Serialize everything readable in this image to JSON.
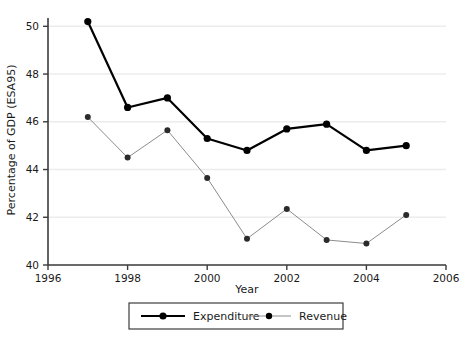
{
  "chart_data": {
    "type": "line",
    "title": "",
    "subtitle": "",
    "xlabel": "Year",
    "ylabel": "Percentage of GDP (ESA95)",
    "xlim": [
      1996,
      2006
    ],
    "ylim": [
      40,
      50.6
    ],
    "xticks": [
      1996,
      1998,
      2000,
      2002,
      2004,
      2006
    ],
    "xtick_labels": [
      "1996",
      "1998",
      "2000",
      "2002",
      "2004",
      "2006"
    ],
    "yticks": [
      40,
      42,
      44,
      46,
      48,
      50
    ],
    "ytick_labels": [
      "40",
      "42",
      "44",
      "46",
      "48",
      "50"
    ],
    "grid": "horizontal",
    "legend_position": "below-center",
    "x": [
      1997,
      1998,
      1999,
      2000,
      2001,
      2002,
      2003,
      2004,
      2005
    ],
    "series": [
      {
        "name": "Expenditure",
        "color": "#000000",
        "line_width": 2.2,
        "marker": "circle",
        "values": [
          50.2,
          46.6,
          47.0,
          45.3,
          44.8,
          45.7,
          45.9,
          44.8,
          45.0
        ]
      },
      {
        "name": "Revenue",
        "color": "#8c8c8c",
        "line_width": 1.0,
        "marker": "circle",
        "values": [
          46.2,
          44.5,
          45.65,
          43.65,
          41.1,
          42.35,
          41.05,
          40.9,
          42.1
        ]
      }
    ]
  },
  "legend": {
    "items": [
      {
        "label": "Expenditure",
        "color": "#000000"
      },
      {
        "label": "Revenue",
        "color": "#8c8c8c"
      }
    ]
  }
}
